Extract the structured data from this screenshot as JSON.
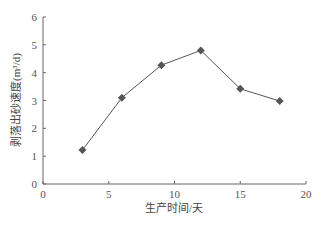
{
  "chart_data": {
    "type": "line",
    "title": "",
    "xlabel": "生产时间/天",
    "ylabel": "剥落出砂速度(m³/d)",
    "x": [
      3,
      6,
      9,
      12,
      15,
      18
    ],
    "series": [
      {
        "name": "剥落出砂速度",
        "values": [
          1.22,
          3.1,
          4.27,
          4.8,
          3.42,
          2.98
        ],
        "marker": "diamond",
        "color": "#555555"
      }
    ],
    "xlim": [
      0,
      20
    ],
    "ylim": [
      0,
      6
    ],
    "xticks": [
      0,
      5,
      10,
      15,
      20
    ],
    "yticks": [
      0,
      1,
      2,
      3,
      4,
      5,
      6
    ],
    "grid": false,
    "legend": null
  }
}
